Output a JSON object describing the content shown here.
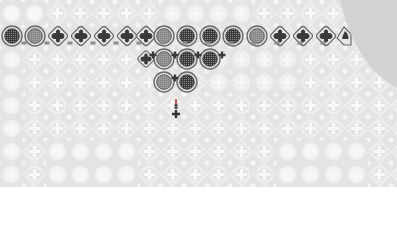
{
  "game": {
    "type": "tile-matching-board",
    "background_color": "#e4e4e4",
    "pattern_light_color": "#f7f7f7",
    "piece_dark_color": "#3a3a3a",
    "piece_mid_color": "#8a8a8a",
    "piece_ring_color": "#6a6a6a",
    "outside_color": "#d2d2d2",
    "grid_spacing_px": 23
  },
  "pieces": [
    {
      "kind": "circle",
      "shade": "dark",
      "x": 12,
      "y": 36
    },
    {
      "kind": "circle",
      "shade": "light",
      "x": 35,
      "y": 36
    },
    {
      "kind": "diamond",
      "x": 58,
      "y": 36
    },
    {
      "kind": "diamond",
      "x": 81,
      "y": 36
    },
    {
      "kind": "diamond",
      "x": 104,
      "y": 36
    },
    {
      "kind": "diamond",
      "x": 127,
      "y": 36
    },
    {
      "kind": "diamond",
      "x": 146,
      "y": 36
    },
    {
      "kind": "circle",
      "shade": "light",
      "x": 164,
      "y": 36
    },
    {
      "kind": "circle",
      "shade": "dark",
      "x": 187,
      "y": 36
    },
    {
      "kind": "circle",
      "shade": "dark",
      "x": 210,
      "y": 36
    },
    {
      "kind": "circle",
      "shade": "dark",
      "x": 233,
      "y": 36
    },
    {
      "kind": "circle",
      "shade": "light",
      "x": 257,
      "y": 36
    },
    {
      "kind": "diamond",
      "x": 280,
      "y": 36
    },
    {
      "kind": "diamond",
      "x": 303,
      "y": 36
    },
    {
      "kind": "diamond",
      "x": 326,
      "y": 36
    },
    {
      "kind": "diamond-partial",
      "x": 344,
      "y": 36
    },
    {
      "kind": "diamond-small",
      "x": 146,
      "y": 59
    },
    {
      "kind": "circle",
      "shade": "light",
      "x": 164,
      "y": 59
    },
    {
      "kind": "circle",
      "shade": "dark",
      "x": 187,
      "y": 59
    },
    {
      "kind": "circle",
      "shade": "dark",
      "x": 210,
      "y": 59
    },
    {
      "kind": "circle",
      "shade": "light",
      "x": 164,
      "y": 82
    },
    {
      "kind": "circle",
      "shade": "dark",
      "x": 187,
      "y": 82
    }
  ],
  "connectors": [
    {
      "x": 153,
      "y": 48
    },
    {
      "x": 175,
      "y": 48
    },
    {
      "x": 198,
      "y": 48
    },
    {
      "x": 222,
      "y": 48
    },
    {
      "x": 175,
      "y": 71
    }
  ],
  "cursor": {
    "kind": "arrow-down-with-cross",
    "x": 176,
    "y": 112
  }
}
